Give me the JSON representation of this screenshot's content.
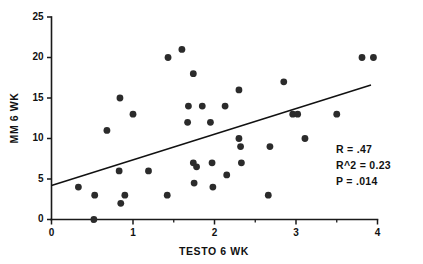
{
  "chart_data": {
    "type": "scatter",
    "title": "",
    "xlabel": "TESTO 6 WK",
    "ylabel": "MM 6 WK",
    "xlim": [
      0,
      4
    ],
    "ylim": [
      0,
      25
    ],
    "xticks": [
      0,
      1,
      2,
      3,
      4
    ],
    "xtick_labels": [
      "0",
      "1",
      "2",
      "3",
      "4"
    ],
    "xminor_ticks": [
      0.5,
      1.5,
      2.5,
      3.5
    ],
    "yticks": [
      0,
      5,
      10,
      15,
      20,
      25
    ],
    "ytick_labels": [
      "0",
      "5",
      "10",
      "15",
      "20",
      "25"
    ],
    "grid": false,
    "legend": null,
    "marker": "filled-circle",
    "marker_color": "#2b2b2b",
    "points": [
      {
        "x": 0.33,
        "y": 4
      },
      {
        "x": 0.52,
        "y": 0
      },
      {
        "x": 0.53,
        "y": 3
      },
      {
        "x": 0.68,
        "y": 11
      },
      {
        "x": 0.83,
        "y": 6
      },
      {
        "x": 0.85,
        "y": 2
      },
      {
        "x": 0.84,
        "y": 15
      },
      {
        "x": 0.9,
        "y": 3
      },
      {
        "x": 1.0,
        "y": 13
      },
      {
        "x": 1.19,
        "y": 6
      },
      {
        "x": 1.42,
        "y": 3
      },
      {
        "x": 1.43,
        "y": 20
      },
      {
        "x": 1.6,
        "y": 21
      },
      {
        "x": 1.67,
        "y": 12
      },
      {
        "x": 1.68,
        "y": 14
      },
      {
        "x": 1.74,
        "y": 18
      },
      {
        "x": 1.74,
        "y": 7
      },
      {
        "x": 1.75,
        "y": 4.5
      },
      {
        "x": 1.78,
        "y": 6.5
      },
      {
        "x": 1.85,
        "y": 14
      },
      {
        "x": 1.95,
        "y": 12
      },
      {
        "x": 1.97,
        "y": 7
      },
      {
        "x": 1.98,
        "y": 4
      },
      {
        "x": 2.13,
        "y": 14
      },
      {
        "x": 2.15,
        "y": 5.5
      },
      {
        "x": 2.3,
        "y": 16
      },
      {
        "x": 2.3,
        "y": 10
      },
      {
        "x": 2.32,
        "y": 9
      },
      {
        "x": 2.33,
        "y": 7
      },
      {
        "x": 2.66,
        "y": 3
      },
      {
        "x": 2.68,
        "y": 9
      },
      {
        "x": 2.85,
        "y": 17
      },
      {
        "x": 2.96,
        "y": 13
      },
      {
        "x": 3.02,
        "y": 13
      },
      {
        "x": 3.11,
        "y": 10
      },
      {
        "x": 3.5,
        "y": 13
      },
      {
        "x": 3.81,
        "y": 20
      },
      {
        "x": 3.95,
        "y": 20
      }
    ],
    "fit_line": {
      "x_start": 0.0,
      "y_start": 4.2,
      "x_end": 3.92,
      "y_end": 16.6
    },
    "annotations": {
      "r": "R  =  .47",
      "r_squared": "R^2  =  0.23",
      "p_value": "P  =  .014"
    }
  }
}
